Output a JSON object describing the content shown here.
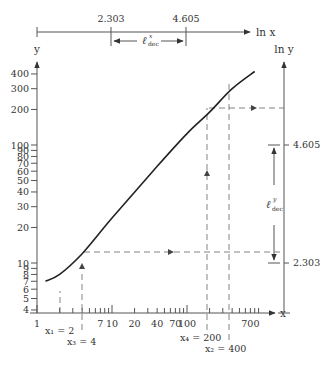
{
  "figure": {
    "type": "log-log plot with logarithmic decade construction",
    "colors": {
      "ink": "#333333",
      "axis": "#555555",
      "dash": "#777777"
    }
  },
  "top_axis": {
    "label": "ln x",
    "ticks": [
      {
        "label": "2.303",
        "value": 2.303
      },
      {
        "label": "4.605",
        "value": 4.605
      }
    ],
    "span_label": "ℓ",
    "span_sup": "x",
    "span_sub": "dec"
  },
  "y_axis": {
    "label": "y",
    "tick_labels": [
      "4",
      "5",
      "6",
      "7",
      "8",
      "9",
      "10",
      "20",
      "30",
      "40",
      "50",
      "60",
      "70",
      "80",
      "90",
      "100",
      "200",
      "300",
      "400"
    ]
  },
  "right_axis": {
    "label": "ln y",
    "ticks": [
      {
        "label": "4.605",
        "value": 4.605
      },
      {
        "label": "2.303",
        "value": 2.303
      }
    ],
    "span_label": "ℓ",
    "span_sup": "y",
    "span_sub": "dec"
  },
  "x_axis": {
    "label": "x",
    "tick_labels": [
      {
        "label": "1",
        "v": 1
      },
      {
        "label": "7",
        "v": 7
      },
      {
        "label": "10",
        "v": 10
      },
      {
        "label": "20",
        "v": 20
      },
      {
        "label": "40",
        "v": 40
      },
      {
        "label": "70",
        "v": 70
      },
      {
        "label": "100",
        "v": 100
      },
      {
        "label": "700",
        "v": 700
      }
    ]
  },
  "annotations": {
    "x1": "x₁ = 2",
    "x3": "x₃ = 4",
    "x4": "x₄ = 200",
    "x2": "x₂ = 400"
  },
  "chart_data": {
    "type": "line",
    "title": "",
    "xlabel": "x",
    "ylabel": "y",
    "xscale": "log",
    "yscale": "log",
    "xlim": [
      1,
      1000
    ],
    "ylim": [
      4,
      500
    ],
    "series": [
      {
        "name": "curve",
        "x": [
          1.3,
          2,
          4,
          10,
          40,
          100,
          200,
          400,
          800
        ],
        "y": [
          7,
          8,
          12,
          24,
          66,
          125,
          190,
          300,
          420
        ]
      }
    ],
    "guides": [
      {
        "x": 2,
        "note": "x1"
      },
      {
        "x": 4,
        "y": 12,
        "note": "x3, horizontal to ln y axis"
      },
      {
        "x": 200,
        "y": 190,
        "note": "x4, horizontal to ln y axis"
      },
      {
        "x": 400,
        "note": "x2"
      }
    ],
    "secondary_axes": {
      "ln_x_ticks": [
        2.303,
        4.605
      ],
      "ln_y_ticks": [
        2.303,
        4.605
      ]
    }
  }
}
